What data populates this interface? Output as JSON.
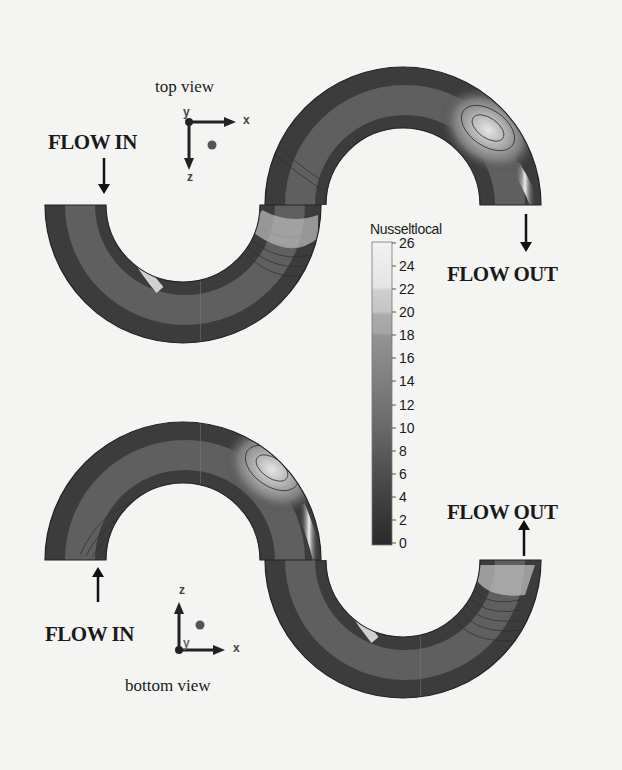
{
  "figure": {
    "top_view": {
      "title": "top view",
      "flow_in_label": "FLOW IN",
      "flow_out_label": "FLOW OUT",
      "axes": {
        "horizontal": "x",
        "vertical": "z",
        "out_of_plane": "y"
      }
    },
    "bottom_view": {
      "title": "bottom view",
      "flow_in_label": "FLOW IN",
      "flow_out_label": "FLOW OUT",
      "axes": {
        "horizontal": "x",
        "vertical": "z",
        "out_of_plane": "y"
      }
    },
    "colorbar": {
      "title": "Nusseltlocal",
      "ticks": [
        "26",
        "24",
        "22",
        "20",
        "18",
        "16",
        "14",
        "12",
        "10",
        "8",
        "6",
        "4",
        "2",
        "0"
      ],
      "min": 0,
      "max": 26,
      "step": 2,
      "colormap": "grayscale (dark = low, light = high)"
    }
  },
  "colors": {
    "background": "#f4f4f2",
    "text": "#1a1a1a",
    "pipe_dark": "#2b2b2b",
    "pipe_mid": "#7a7a7a",
    "pipe_light": "#e8e8e8"
  }
}
